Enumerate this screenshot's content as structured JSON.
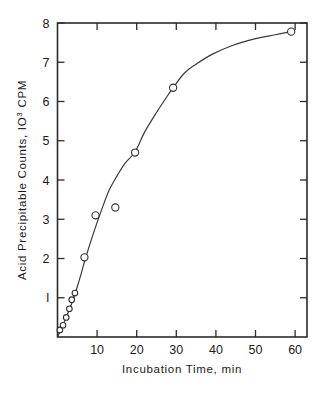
{
  "figure": {
    "background_color": "#ffffff",
    "ink_color": "#2b2b2b",
    "marker_face_color": "#ffffff"
  },
  "chart_data": {
    "type": "scatter",
    "title": "",
    "xlabel": "Incubation Time, min",
    "ylabel": "Acid  Precipitable  Counts,  IO3 CPM",
    "ylabel_parts": {
      "prefix": "Acid  Precipitable  Counts,  IO",
      "superscript": "3",
      "suffix": " CPM"
    },
    "xlim": [
      0,
      63
    ],
    "ylim": [
      0,
      8
    ],
    "grid": false,
    "legend": null,
    "x_ticks": [
      10,
      20,
      30,
      40,
      50,
      60
    ],
    "x_tick_labels": [
      "10",
      "20",
      "30",
      "40",
      "50",
      "60"
    ],
    "x_minor_ticks": [],
    "y_ticks": [
      1,
      2,
      3,
      4,
      5,
      6,
      7,
      8
    ],
    "y_tick_labels": [
      "I",
      "2",
      "3",
      "4",
      "5",
      "6",
      "7",
      "8"
    ],
    "tick_direction": "in",
    "frame": "box",
    "series": [
      {
        "name": "Acid precipitable counts",
        "marker": "open-circle",
        "x": [
          0.6,
          1.4,
          2.2,
          3.0,
          3.6,
          4.4,
          6.8,
          9.6,
          14.6,
          19.6,
          29.2,
          59.0
        ],
        "y": [
          0.18,
          0.3,
          0.5,
          0.72,
          0.95,
          1.12,
          2.03,
          3.1,
          3.3,
          4.7,
          6.35,
          7.78
        ]
      }
    ],
    "fit_curve": {
      "name": "smoothed trend line",
      "x": [
        0.0,
        1.0,
        2.0,
        3.0,
        4.0,
        5.0,
        6.0,
        7.0,
        9.0,
        11.0,
        13.0,
        15.0,
        17.0,
        19.6,
        22.0,
        25.0,
        28.0,
        29.2,
        32.0,
        35.0,
        39.0,
        44.0,
        50.0,
        55.0,
        59.0
      ],
      "y": [
        0.0,
        0.22,
        0.45,
        0.7,
        0.97,
        1.28,
        1.62,
        1.98,
        2.62,
        3.2,
        3.73,
        4.1,
        4.42,
        4.72,
        5.22,
        5.72,
        6.18,
        6.35,
        6.72,
        6.95,
        7.2,
        7.42,
        7.6,
        7.7,
        7.78
      ]
    }
  }
}
